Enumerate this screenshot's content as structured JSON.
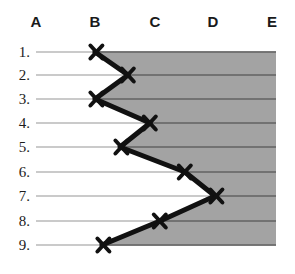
{
  "chart_data": {
    "type": "line",
    "title": "",
    "xlabel": "",
    "ylabel": "",
    "orientation": "vertical-profile",
    "columns": [
      "A",
      "B",
      "C",
      "D",
      "E"
    ],
    "column_x": [
      36,
      95,
      155,
      213,
      272
    ],
    "rows": [
      "1.",
      "2.",
      "3.",
      "4.",
      "5.",
      "6.",
      "7.",
      "8.",
      "9."
    ],
    "row_y": [
      52,
      75,
      99,
      123,
      147,
      172,
      196,
      221,
      245
    ],
    "marker": "x-cross",
    "series": [
      {
        "name": "profile",
        "points": [
          {
            "row": "1.",
            "column": "B",
            "x": 95,
            "y": 52
          },
          {
            "row": "2.",
            "column": "B-C",
            "x": 128,
            "y": 75
          },
          {
            "row": "3.",
            "column": "B",
            "x": 95,
            "y": 99
          },
          {
            "row": "4.",
            "column": "C",
            "x": 150,
            "y": 123
          },
          {
            "row": "5.",
            "column": "B-C",
            "x": 120,
            "y": 147
          },
          {
            "row": "6.",
            "column": "C-D",
            "x": 185,
            "y": 172
          },
          {
            "row": "7.",
            "column": "D",
            "x": 215,
            "y": 196
          },
          {
            "row": "8.",
            "column": "C",
            "x": 160,
            "y": 221
          },
          {
            "row": "9.",
            "column": "B",
            "x": 102,
            "y": 245
          }
        ]
      }
    ],
    "shaded_region": {
      "label": "right-of-profile",
      "color": "#a3a3a3",
      "right_edge_x": 276,
      "top_y": 52,
      "bottom_y": 245
    },
    "gridlines": {
      "visible": true,
      "color_light": "#b9b9b9",
      "color_on_shade": "#5d5d5d",
      "start_x": 36,
      "end_x": 276
    },
    "line_style": {
      "color": "#111111",
      "width": 5
    },
    "marker_style": {
      "color": "#111111",
      "width": 4,
      "size": 11
    }
  }
}
